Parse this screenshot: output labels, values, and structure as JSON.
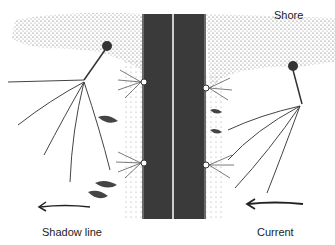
{
  "diagram": {
    "labels": {
      "shore": "Shore",
      "shadow_line": "Shadow line",
      "current": "Current"
    },
    "colors": {
      "road": "#3a3a3a",
      "lane_line": "#ffffff",
      "ink": "#333333",
      "stipple": "#555555"
    }
  }
}
